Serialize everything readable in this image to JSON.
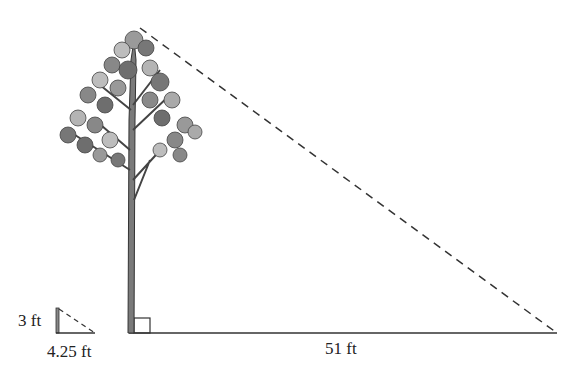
{
  "diagram": {
    "labels": {
      "small_height": "3 ft",
      "small_shadow": "4.25 ft",
      "tree_shadow": "51 ft"
    },
    "colors": {
      "line": "#333333",
      "foliage_dark": "#6e6e6e",
      "foliage_light": "#b4b4b4",
      "trunk": "#7a7a7a"
    }
  }
}
